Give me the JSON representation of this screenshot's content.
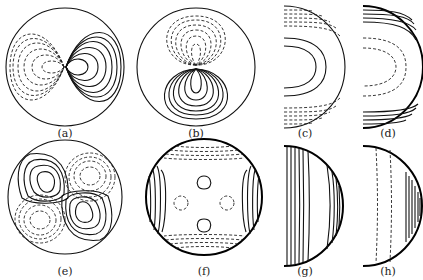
{
  "figure": {
    "panels": [
      {
        "id": "a",
        "label": "(a)",
        "shape": "disk",
        "description": "dipole contours, dashed left lobes, solid right lobes"
      },
      {
        "id": "b",
        "label": "(b)",
        "shape": "disk",
        "description": "dipole contours, dashed upper lobes, solid lower lobes"
      },
      {
        "id": "c",
        "label": "(c)",
        "shape": "half-disk",
        "description": "solid nested arcs in centre, dashed arcs near top and bottom"
      },
      {
        "id": "d",
        "label": "(d)",
        "shape": "half-disk",
        "description": "dashed nested arcs in centre, solid arcs near top and bottom"
      },
      {
        "id": "e",
        "label": "(e)",
        "shape": "disk",
        "description": "four-cell quadrupole: solid top-left and bottom-right, dashed top-right and bottom-left"
      },
      {
        "id": "f",
        "label": "(f)",
        "shape": "disk",
        "description": "boundary-layer contours, solid small ovals top and bottom, dashed small circles left and right"
      },
      {
        "id": "g",
        "label": "(g)",
        "shape": "half-disk",
        "description": "solid near-vertical contour lines"
      },
      {
        "id": "h",
        "label": "(h)",
        "shape": "half-disk",
        "description": "two dashed vertical lines, solid vertical lines near right boundary"
      }
    ]
  }
}
